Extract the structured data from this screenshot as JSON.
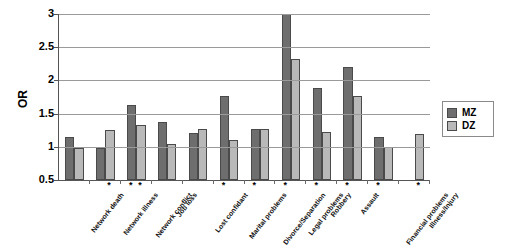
{
  "chart_data": {
    "type": "bar",
    "title": "",
    "xlabel": "",
    "ylabel": "OR",
    "ylim": [
      0.5,
      3.0
    ],
    "ytick_labels": [
      "3",
      "2.5",
      "2",
      "1.5",
      "1",
      "0.5"
    ],
    "ytick_values": [
      3,
      2.5,
      2,
      1.5,
      1,
      0.5
    ],
    "grid": true,
    "legend_position": "right",
    "categories": [
      "Network death",
      "Network illness",
      "Network conflict",
      "Job loss",
      "Lost confidant",
      "Marital problems",
      "Divorce/Separation",
      "Legal problems",
      "Robbery",
      "Assault",
      "Financial problems",
      "Illness/Injury"
    ],
    "series": [
      {
        "name": "MZ",
        "color": "#6e6e6e",
        "values": [
          1.15,
          0.98,
          1.63,
          1.37,
          1.21,
          1.77,
          1.27,
          3.0,
          1.88,
          2.2,
          1.15,
          null
        ]
      },
      {
        "name": "DZ",
        "color": "#b9b9b9",
        "values": [
          0.99,
          1.25,
          1.33,
          1.04,
          1.27,
          1.1,
          1.27,
          2.33,
          1.22,
          1.77,
          1.0,
          1.2
        ]
      }
    ],
    "significance_marker": "*",
    "significance": {
      "Network illness": [
        "DZ"
      ],
      "Network conflict": [
        "MZ",
        "DZ"
      ],
      "Marital problems": [
        "MZ"
      ],
      "Divorce/Separation": [
        "MZ"
      ],
      "Legal problems": [
        "MZ"
      ],
      "Robbery": [
        "MZ"
      ],
      "Assault": [
        "MZ"
      ],
      "Financial problems": [
        "MZ"
      ],
      "Illness/Injury": [
        "DZ"
      ]
    }
  },
  "legend": {
    "items": [
      {
        "label": "MZ",
        "key": "mz"
      },
      {
        "label": "DZ",
        "key": "dz"
      }
    ]
  }
}
